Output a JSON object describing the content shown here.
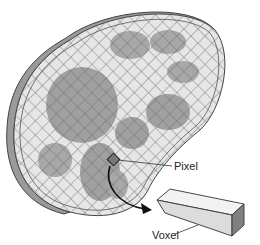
{
  "diagram": {
    "labels": {
      "pixel": "Pixel",
      "voxel": "Voxel"
    },
    "colors": {
      "slice_fill": "#e6e6e6",
      "grid_line": "#6a6a6a",
      "organ": "#a0a0a0",
      "edge": "#9a9a9a",
      "pixel": "#777777",
      "voxel_top": "#f0f0f0",
      "voxel_front": "#dcdcdc",
      "voxel_end": "#808080"
    }
  }
}
